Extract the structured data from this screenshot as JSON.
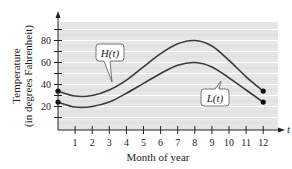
{
  "chart_data": {
    "type": "line",
    "title": "",
    "xlabel": "Month of year",
    "ylabel": "Temperature (in degrees Fahrenheit)",
    "ylabel_lines": [
      "Temperature",
      "(in degrees Fahrenheit)"
    ],
    "x_axis_var": "t",
    "xlim": [
      0,
      12
    ],
    "ylim": [
      0,
      95
    ],
    "x_ticks": [
      1,
      2,
      3,
      4,
      5,
      6,
      7,
      8,
      9,
      10,
      11,
      12
    ],
    "y_ticks": [
      20,
      40,
      60,
      80
    ],
    "y_minor_ticks": [
      10,
      30,
      50,
      70,
      90
    ],
    "grid": true,
    "series": [
      {
        "name": "H(t)",
        "x": [
          0,
          1,
          2,
          3,
          4,
          5,
          6,
          7,
          8,
          9,
          10,
          11,
          12
        ],
        "values": [
          34,
          29.5,
          30,
          35,
          44,
          56,
          68,
          77,
          80,
          75,
          62,
          47,
          34
        ],
        "endpoints": [
          [
            0,
            34
          ],
          [
            12,
            34
          ]
        ]
      },
      {
        "name": "L(t)",
        "x": [
          0,
          1,
          2,
          3,
          4,
          5,
          6,
          7,
          8,
          9,
          10,
          11,
          12
        ],
        "values": [
          24,
          19.5,
          20,
          24,
          32,
          41,
          50,
          57.5,
          60,
          56,
          46,
          35,
          24
        ],
        "endpoints": [
          [
            0,
            24
          ],
          [
            12,
            24
          ]
        ]
      }
    ],
    "annotations": [
      {
        "text": "H(t)",
        "points_to_series": "H(t)"
      },
      {
        "text": "L(t)",
        "points_to_series": "L(t)"
      }
    ],
    "colors": {
      "plot_background": "#e6e6e6",
      "gridline": "#ffffff",
      "curve": "#3a3a3a",
      "axis": "#222222"
    }
  }
}
